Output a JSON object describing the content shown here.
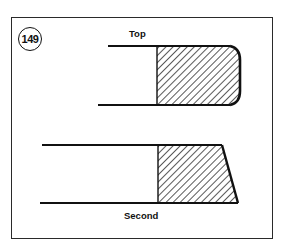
{
  "figure": {
    "number": "149",
    "labels": {
      "top": "Top",
      "second": "Second"
    },
    "diagrams": [
      {
        "name": "top-ring-cross-section",
        "profile": "barrel-faced (rounded outer face)"
      },
      {
        "name": "second-ring-cross-section",
        "profile": "taper-faced (angled outer face)"
      }
    ],
    "colors": {
      "line": "#111111",
      "background": "#ffffff"
    }
  }
}
